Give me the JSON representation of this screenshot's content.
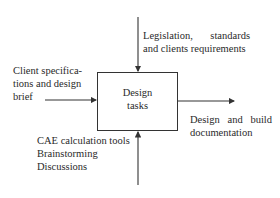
{
  "diagram": {
    "type": "IDEF0 function block",
    "box": {
      "label_line1": "Design",
      "label_line2": "tasks"
    },
    "controls": {
      "line1_a": "Legislation,",
      "line1_b": "standards",
      "line2": "and clients requirements"
    },
    "inputs": {
      "line1": "Client specifica-",
      "line2": "tions and design",
      "line3": "brief"
    },
    "outputs": {
      "line1_a": "Design",
      "line1_b": "and",
      "line1_c": "build",
      "line2": "documentation"
    },
    "mechanisms": {
      "line1": "CAE calculation tools",
      "line2": "Brainstorming",
      "line3": "Discussions"
    },
    "colors": {
      "line": "#333333",
      "text": "#2a2a2a",
      "background": "#ffffff"
    }
  }
}
